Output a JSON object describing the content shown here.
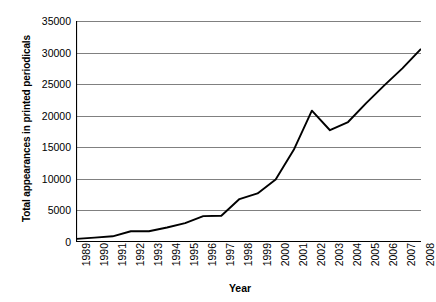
{
  "chart_data": {
    "type": "line",
    "title": "",
    "xlabel": "Year",
    "ylabel": "Total appearances in printed periodicals",
    "categories": [
      "1989",
      "1990",
      "1991",
      "1992",
      "1993",
      "1994",
      "1995",
      "1996",
      "1997",
      "1998",
      "1999",
      "2000",
      "2001",
      "2002",
      "2003",
      "2004",
      "2005",
      "2006",
      "2007",
      "2008"
    ],
    "x": [
      1989,
      1990,
      1991,
      1992,
      1993,
      1994,
      1995,
      1996,
      1997,
      1998,
      1999,
      2000,
      2001,
      2002,
      2003,
      2004,
      2005,
      2006,
      2007,
      2008
    ],
    "values": [
      500,
      700,
      900,
      1700,
      1700,
      2300,
      3000,
      4100,
      4150,
      6800,
      7700,
      9900,
      14600,
      20800,
      17700,
      19000,
      22000,
      24800,
      27500,
      30500
    ],
    "series": [
      {
        "name": "Total appearances in printed periodicals",
        "values": [
          500,
          700,
          900,
          1700,
          1700,
          2300,
          3000,
          4100,
          4150,
          6800,
          7700,
          9900,
          14600,
          20800,
          17700,
          19000,
          22000,
          24800,
          27500,
          30500
        ]
      }
    ],
    "ylim": [
      0,
      35000
    ],
    "yticks": [
      0,
      5000,
      10000,
      15000,
      20000,
      25000,
      30000,
      35000
    ],
    "ytick_labels": [
      "0",
      "5000",
      "10000",
      "15000",
      "20000",
      "25000",
      "30000",
      "35000"
    ],
    "grid": "horizontal",
    "legend": "none",
    "colors": {
      "line": "#000000",
      "gridline": "#808080",
      "axis": "#000000",
      "background": "#ffffff",
      "text": "#000000"
    }
  }
}
